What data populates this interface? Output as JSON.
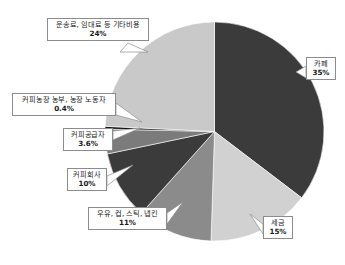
{
  "chart_data": {
    "type": "pie",
    "title": "",
    "subtitle": "",
    "xlabel": "",
    "ylabel": "",
    "legend_position": "callout-labels",
    "grid": false,
    "units": "%",
    "start_angle_deg": 0,
    "direction": "clockwise",
    "categories": [
      "카페",
      "세금",
      "우유, 컵, 스틱, 냅킨",
      "커피회사",
      "커피공급자",
      "커피농장 농부, 농장 노동자",
      "운송료, 임대료 등 기타비용"
    ],
    "values": [
      35,
      15,
      11,
      10,
      3.6,
      0.4,
      24
    ],
    "value_labels": [
      "35%",
      "15%",
      "11%",
      "10%",
      "3.6%",
      "0.4%",
      "24%"
    ],
    "colors": [
      "#3b3b3b",
      "#d1d1d1",
      "#8b8b8b",
      "#3b3b3b",
      "#7b7b7b",
      "#141414",
      "#c9c9c9"
    ],
    "slices": [
      {
        "name": "카페",
        "value": 35,
        "value_label": "35%",
        "color": "#3b3b3b"
      },
      {
        "name": "세금",
        "value": 15,
        "value_label": "15%",
        "color": "#d1d1d1"
      },
      {
        "name": "우유, 컵, 스틱, 냅킨",
        "value": 11,
        "value_label": "11%",
        "color": "#8b8b8b"
      },
      {
        "name": "커피회사",
        "value": 10,
        "value_label": "10%",
        "color": "#3b3b3b"
      },
      {
        "name": "커피공급자",
        "value": 3.6,
        "value_label": "3.6%",
        "color": "#7b7b7b"
      },
      {
        "name": "커피농장 농부, 농장 노동자",
        "value": 0.4,
        "value_label": "0.4%",
        "color": "#141414"
      },
      {
        "name": "운송료, 임대료 등 기타비용",
        "value": 24,
        "value_label": "24%",
        "color": "#c9c9c9"
      }
    ]
  },
  "callouts": {
    "other": {
      "label": "운송료, 임대료 등 기타비용",
      "value": "24%"
    },
    "cafe": {
      "label": "카페",
      "value": "35%"
    },
    "farmers": {
      "label": "커피농장 농부, 농장 노동자",
      "value": "0.4%"
    },
    "suppliers": {
      "label": "커피공급자",
      "value": "3.6%"
    },
    "company": {
      "label": "커피회사",
      "value": "10%"
    },
    "supplies": {
      "label": "우유, 컵, 스틱, 냅킨",
      "value": "11%"
    },
    "tax": {
      "label": "세금",
      "value": "15%"
    }
  },
  "style": {
    "background": "#ffffff",
    "callout_border": "#8c8c8c",
    "leader_line": "#8c8c8c",
    "text": "#1a1a1a"
  }
}
